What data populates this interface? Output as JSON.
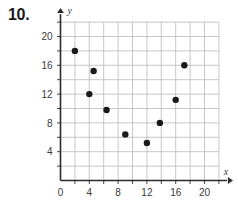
{
  "problem": {
    "number_label": "10."
  },
  "chart_data": {
    "type": "scatter",
    "title": "",
    "xlabel": "x",
    "ylabel": "y",
    "xlim": [
      0,
      22
    ],
    "ylim": [
      0,
      22
    ],
    "xticks": [
      0,
      4,
      8,
      12,
      16,
      20
    ],
    "yticks": [
      4,
      8,
      12,
      16,
      20
    ],
    "xtick_labels": [
      "0",
      "4",
      "8",
      "12",
      "16",
      "20"
    ],
    "ytick_labels": [
      "4",
      "8",
      "12",
      "16",
      "20"
    ],
    "grid": true,
    "grid_step": 2,
    "grid_color": "#b9b9b9",
    "axis_color": "#2b2b2b",
    "point_color": "#1a1a1a",
    "point_radius": 3.2,
    "legend": null,
    "points": [
      {
        "x": 2,
        "y": 18
      },
      {
        "x": 4,
        "y": 12
      },
      {
        "x": 4.6,
        "y": 15.2
      },
      {
        "x": 6.4,
        "y": 9.8
      },
      {
        "x": 9,
        "y": 6.4
      },
      {
        "x": 12,
        "y": 5.2
      },
      {
        "x": 13.8,
        "y": 8
      },
      {
        "x": 16,
        "y": 11.2
      },
      {
        "x": 17.2,
        "y": 16
      }
    ]
  }
}
